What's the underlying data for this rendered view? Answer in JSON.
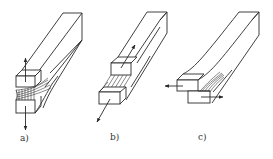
{
  "figure": {
    "line_color": "#2a2a2a",
    "background": "#ffffff",
    "panels": [
      {
        "id": "a",
        "label": "a)",
        "mode": "opening",
        "arrows": [
          "up",
          "down"
        ]
      },
      {
        "id": "b",
        "label": "b)",
        "mode": "sliding",
        "arrows": [
          "up-right",
          "down-left"
        ]
      },
      {
        "id": "c",
        "label": "c)",
        "mode": "tearing",
        "arrows": [
          "left",
          "right"
        ]
      }
    ]
  }
}
